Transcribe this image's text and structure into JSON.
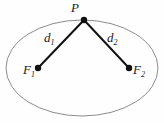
{
  "figure": {
    "type": "ellipse-foci-diagram",
    "background_color": "#fefefe",
    "ellipse": {
      "name": "ellipse-outline",
      "center_x": 82,
      "center_y": 68,
      "radius_x": 76,
      "radius_y": 48,
      "stroke_color": "#8c8c8c",
      "stroke_width": 1,
      "fill": "none"
    },
    "points": [
      {
        "id": "P",
        "label": "P",
        "x": 84,
        "y": 20,
        "dot_radius": 3.2,
        "color": "#111111"
      },
      {
        "id": "F1",
        "label": "F",
        "subscript": "1",
        "x": 38,
        "y": 68,
        "dot_radius": 3.2,
        "color": "#111111"
      },
      {
        "id": "F2",
        "label": "F",
        "subscript": "2",
        "x": 129,
        "y": 68,
        "dot_radius": 3.2,
        "color": "#111111"
      }
    ],
    "segments": [
      {
        "id": "d1",
        "label": "d",
        "subscript": "1",
        "from": "P",
        "to": "F1",
        "x1": 84,
        "y1": 20,
        "x2": 38,
        "y2": 68,
        "stroke_color": "#111111",
        "stroke_width": 2
      },
      {
        "id": "d2",
        "label": "d",
        "subscript": "2",
        "from": "P",
        "to": "F2",
        "x1": 84,
        "y1": 20,
        "x2": 129,
        "y2": 68,
        "stroke_color": "#111111",
        "stroke_width": 2
      }
    ],
    "labels": {
      "P": "P",
      "d1_base": "d",
      "d1_sub": "1",
      "d2_base": "d",
      "d2_sub": "2",
      "F1_base": "F",
      "F1_sub": "1",
      "F2_base": "F",
      "F2_sub": "2"
    }
  }
}
